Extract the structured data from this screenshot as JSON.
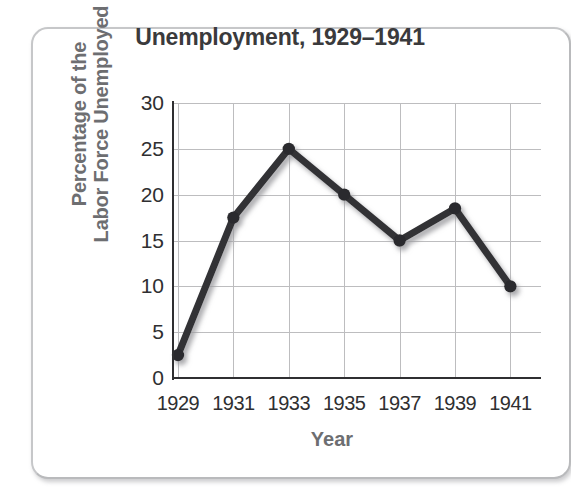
{
  "chart_data": {
    "type": "line",
    "title": "Unemployment, 1929–1941",
    "xlabel": "Year",
    "ylabel": "Percentage of the Labor Force Unemployed",
    "ylabel_lines": [
      "Percentage of the",
      "Labor Force Unemployed"
    ],
    "categories": [
      "1929",
      "1931",
      "1933",
      "1935",
      "1937",
      "1939",
      "1941"
    ],
    "x": [
      1929,
      1931,
      1933,
      1935,
      1937,
      1939,
      1941
    ],
    "values": [
      2.5,
      17.5,
      25,
      20,
      15,
      18.5,
      10
    ],
    "series": [
      {
        "name": "Percentage of the Labor Force Unemployed",
        "values": [
          2.5,
          17.5,
          25,
          20,
          15,
          18.5,
          10
        ]
      }
    ],
    "ylim": [
      0,
      30
    ],
    "ytick_labels": [
      "0",
      "5",
      "10",
      "15",
      "20",
      "25",
      "30"
    ],
    "yticks": [
      0,
      5,
      10,
      15,
      20,
      25,
      30
    ],
    "grid": true,
    "legend": "none",
    "line_color": "#333336",
    "marker_color": "#2b2b2e",
    "grid_color": "#bdbdbf",
    "axis_color": "#2f2f31",
    "title_color": "#3a3a3c",
    "axis_label_color": "#6d6e71"
  }
}
